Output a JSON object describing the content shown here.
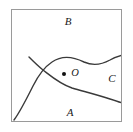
{
  "figure": {
    "background_color": "#ffffff",
    "frame": {
      "name": "bounding-box",
      "stroke_color": "#9a9a9a",
      "stroke_width": 1,
      "x": 11,
      "y": 9,
      "width": 111,
      "height": 113,
      "fill": "#ffffff"
    },
    "curve_color": "#3a3a3a",
    "curve_width": 1.4,
    "curves": [
      {
        "name": "upper-boundary-curve",
        "description": "rises from lower-left of frame, crosses the second curve, arcs over the point O, dips, then rises to exit the right edge",
        "path": "M 14,120 C 20,112 26,100 33,86 C 38,76 43,68 52,62 C 62,55 74,57 84,62 C 93,66 101,65 110,60 C 115,57 119,56 122,55"
      },
      {
        "name": "lower-boundary-curve",
        "description": "enters from the crossing near the left, runs below the point O, descends gently and exits the right edge",
        "path": "M 30,58 C 34,62 38,66 43,70 C 52,77 60,84 72,88 C 86,92 98,95 110,99 C 116,101 119,102 122,103"
      }
    ],
    "points": [
      {
        "name": "point-o",
        "label": "O",
        "dot_x": 64,
        "dot_y": 74,
        "dot_radius": 2,
        "dot_color": "#111111",
        "label_x": 75,
        "label_y": 74
      }
    ],
    "labels": [
      {
        "name": "region-label-b",
        "text": "B",
        "x": 68,
        "y": 22
      },
      {
        "name": "region-label-c",
        "text": "C",
        "x": 112,
        "y": 79
      },
      {
        "name": "region-label-a",
        "text": "A",
        "x": 70,
        "y": 113
      }
    ]
  }
}
